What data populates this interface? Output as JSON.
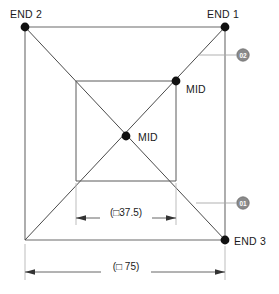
{
  "drawing": {
    "title": "Square cross-section path with midpoints",
    "nodes": [
      {
        "id": "end2",
        "label": "END 2",
        "x": 25,
        "y": 27,
        "label_x": 10,
        "label_y": 18
      },
      {
        "id": "end1",
        "label": "END 1",
        "x": 225,
        "y": 27,
        "label_x": 208,
        "label_y": 18
      },
      {
        "id": "end3",
        "label": "END 3",
        "x": 225,
        "y": 240,
        "label_x": 233,
        "label_y": 244
      },
      {
        "id": "mid_outer",
        "label": "MID",
        "x": 176,
        "y": 81,
        "label_x": 186,
        "label_y": 92
      },
      {
        "id": "mid_center",
        "label": "MID",
        "x": 126,
        "y": 136,
        "label_x": 137,
        "label_y": 140
      }
    ],
    "bubbles": [
      {
        "id": "02",
        "label": "02",
        "cx": 243,
        "cy": 55,
        "r": 6.2
      },
      {
        "id": "01",
        "label": "01",
        "cx": 243,
        "cy": 203,
        "r": 6.2
      }
    ],
    "dimensions": [
      {
        "id": "inner-width",
        "text": "(□37.5)",
        "value": "37.5",
        "x1": 76,
        "x2": 176,
        "y": 218,
        "text_x": 126,
        "text_y": 214
      },
      {
        "id": "outer-width",
        "text": "(□ 75)",
        "value": "75",
        "x1": 25,
        "x2": 225,
        "y": 272,
        "text_x": 126,
        "text_y": 268
      }
    ],
    "geometry": {
      "outer_square": {
        "left": 25,
        "top": 27,
        "right": 225,
        "bottom": 240
      },
      "inner_square": {
        "left": 76,
        "top": 81,
        "right": 176,
        "bottom": 181
      }
    }
  }
}
